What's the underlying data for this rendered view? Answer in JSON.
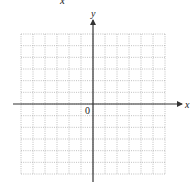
{
  "figure": {
    "top_label": "x",
    "x_axis_label": "x",
    "y_axis_label": "y",
    "origin_label": "0",
    "grid": {
      "columns": 12,
      "rows": 12,
      "line_style": "dotted",
      "line_color": "#b0b0b0"
    },
    "axis_color": "#333333"
  }
}
